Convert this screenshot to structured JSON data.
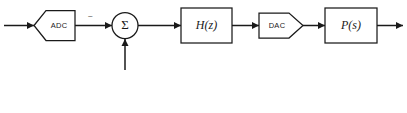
{
  "diagram": {
    "type": "control-system-block-diagram",
    "background_color": "#ffffff",
    "line_color": "#1a1a1a",
    "blocks": [
      {
        "id": "adc",
        "label": "ADC",
        "shape": "hexagon-notched-left",
        "label_style": "sans"
      },
      {
        "id": "sum",
        "label": "Σ",
        "shape": "circle",
        "label_style": "serif"
      },
      {
        "id": "hz",
        "label": "H(z)",
        "shape": "rectangle",
        "label_style": "serif-italic"
      },
      {
        "id": "dac",
        "label": "DAC",
        "shape": "pentagon-point-right",
        "label_style": "sans"
      },
      {
        "id": "ps",
        "label": "P(s)",
        "shape": "rectangle",
        "label_style": "serif-italic"
      }
    ],
    "signs": [
      {
        "id": "sum-minus",
        "label": "−",
        "attached_to": "sum",
        "port": "left"
      }
    ],
    "connections": [
      {
        "id": "input-to-adc",
        "from": "input",
        "to": "adc",
        "arrow": true
      },
      {
        "id": "adc-to-sum",
        "from": "adc",
        "to": "sum",
        "arrow": true
      },
      {
        "id": "ref-to-sum",
        "from": "reference-input",
        "to": "sum",
        "arrow": true,
        "direction": "up"
      },
      {
        "id": "sum-to-hz",
        "from": "sum",
        "to": "hz",
        "arrow": true
      },
      {
        "id": "hz-to-dac",
        "from": "hz",
        "to": "dac",
        "arrow": true
      },
      {
        "id": "dac-to-ps",
        "from": "dac",
        "to": "ps",
        "arrow": true
      },
      {
        "id": "ps-to-output",
        "from": "ps",
        "to": "output",
        "arrow": true
      }
    ],
    "caption": {
      "text": "",
      "visible": false
    }
  }
}
